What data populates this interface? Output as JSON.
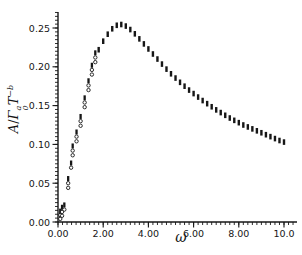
{
  "figure": {
    "background": "#ffffff",
    "ink": "#161616"
  },
  "chart_data": {
    "type": "scatter",
    "title": "",
    "xlabel": "ω",
    "ylabel": "A/Γ₀ᵃT⁻ᵇ",
    "ylabel_parts": {
      "numerator": "A",
      "slash": "/",
      "gamma": "Γ",
      "gamma_sup": "a",
      "gamma_sub": "0",
      "t": "T",
      "t_sup": "−b"
    },
    "xlim": [
      0,
      10.55
    ],
    "ylim": [
      0,
      0.272
    ],
    "grid": false,
    "legend": null,
    "x_major_ticks": [
      {
        "value": 0,
        "label": "0.00"
      },
      {
        "value": 2,
        "label": "2.00"
      },
      {
        "value": 4,
        "label": "4.00"
      },
      {
        "value": 6,
        "label": "6.00"
      },
      {
        "value": 8,
        "label": "8.00"
      },
      {
        "value": 10,
        "label": "10.0"
      }
    ],
    "x_minor_step": 0.2,
    "x_minor_max": 10.4,
    "y_major_ticks": [
      {
        "value": 0.0,
        "label": "0.00"
      },
      {
        "value": 0.05,
        "label": "0.05"
      },
      {
        "value": 0.1,
        "label": "0.10"
      },
      {
        "value": 0.15,
        "label": "0.15"
      },
      {
        "value": 0.2,
        "label": "0.20"
      },
      {
        "value": 0.25,
        "label": "0.25"
      }
    ],
    "y_minor_step": 0.005,
    "y_minor_max": 0.27,
    "series": [
      {
        "name": "low-frequency-clusters",
        "marker": "open-circle-cluster",
        "clusters": [
          {
            "omega": 0.1,
            "a": [
              0.004,
              0.009,
              0.014
            ]
          },
          {
            "omega": 0.18,
            "a": [
              0.008,
              0.013,
              0.019
            ]
          },
          {
            "omega": 0.28,
            "a": [
              0.016,
              0.022
            ]
          },
          {
            "omega": 0.45,
            "a": [
              0.044,
              0.05,
              0.056
            ]
          },
          {
            "omega": 0.58,
            "a": [
              0.07,
              0.076
            ]
          },
          {
            "omega": 0.65,
            "a": [
              0.086,
              0.092,
              0.098
            ]
          },
          {
            "omega": 0.82,
            "a": [
              0.104,
              0.11,
              0.116
            ]
          },
          {
            "omega": 1.0,
            "a": [
              0.124,
              0.13,
              0.136
            ]
          },
          {
            "omega": 1.18,
            "a": [
              0.148,
              0.154,
              0.16
            ]
          },
          {
            "omega": 1.35,
            "a": [
              0.17,
              0.176,
              0.182
            ]
          },
          {
            "omega": 1.5,
            "a": [
              0.19,
              0.196,
              0.202
            ]
          },
          {
            "omega": 1.65,
            "a": [
              0.206,
              0.212,
              0.218
            ]
          }
        ]
      },
      {
        "name": "main-curve",
        "marker": "vertical-dash",
        "points": [
          [
            1.8,
            0.222
          ],
          [
            2.0,
            0.233
          ],
          [
            2.2,
            0.242
          ],
          [
            2.4,
            0.249
          ],
          [
            2.6,
            0.2535
          ],
          [
            2.8,
            0.2545
          ],
          [
            3.0,
            0.2525
          ],
          [
            3.2,
            0.248
          ],
          [
            3.4,
            0.2425
          ],
          [
            3.6,
            0.236
          ],
          [
            3.8,
            0.2295
          ],
          [
            4.0,
            0.223
          ],
          [
            4.2,
            0.2165
          ],
          [
            4.4,
            0.21
          ],
          [
            4.6,
            0.2035
          ],
          [
            4.8,
            0.197
          ],
          [
            5.0,
            0.191
          ],
          [
            5.2,
            0.1855
          ],
          [
            5.4,
            0.18
          ],
          [
            5.6,
            0.175
          ],
          [
            5.8,
            0.17
          ],
          [
            6.0,
            0.1655
          ],
          [
            6.2,
            0.161
          ],
          [
            6.4,
            0.1565
          ],
          [
            6.6,
            0.1525
          ],
          [
            6.8,
            0.1485
          ],
          [
            7.0,
            0.1445
          ],
          [
            7.2,
            0.141
          ],
          [
            7.4,
            0.1375
          ],
          [
            7.6,
            0.134
          ],
          [
            7.8,
            0.131
          ],
          [
            8.0,
            0.128
          ],
          [
            8.2,
            0.125
          ],
          [
            8.4,
            0.1225
          ],
          [
            8.6,
            0.12
          ],
          [
            8.8,
            0.1175
          ],
          [
            9.0,
            0.115
          ],
          [
            9.2,
            0.1125
          ],
          [
            9.4,
            0.11
          ],
          [
            9.6,
            0.1075
          ],
          [
            9.8,
            0.105
          ],
          [
            10.0,
            0.103
          ]
        ]
      }
    ]
  }
}
